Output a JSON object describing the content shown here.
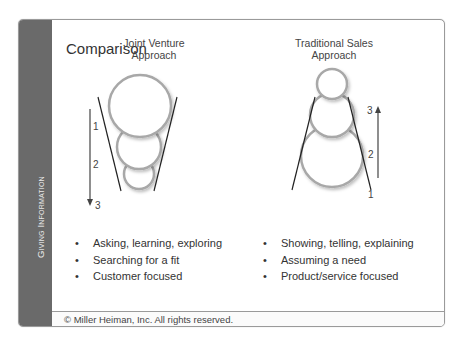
{
  "sidebar": {
    "label": "Giving Information"
  },
  "title": "Comparison",
  "left": {
    "heading_line1": "Joint Venture",
    "heading_line2": "Approach",
    "steps": [
      "1",
      "2",
      "3"
    ],
    "arrow_direction": "down",
    "bullets": [
      "Asking, learning, exploring",
      "Searching for a fit",
      "Customer focused"
    ]
  },
  "right": {
    "heading_line1": "Traditional Sales",
    "heading_line2": "Approach",
    "steps": [
      "1",
      "2",
      "3"
    ],
    "arrow_direction": "up",
    "bullets": [
      "Showing, telling, explaining",
      "Assuming a need",
      "Product/service focused"
    ]
  },
  "footer": {
    "copyright": "© Miller Heiman, Inc. All rights reserved."
  },
  "colors": {
    "sidebar": "#6a6a6a",
    "circle_stroke": "#a8a8a8",
    "line": "#222222",
    "border": "#9a9a9a"
  }
}
